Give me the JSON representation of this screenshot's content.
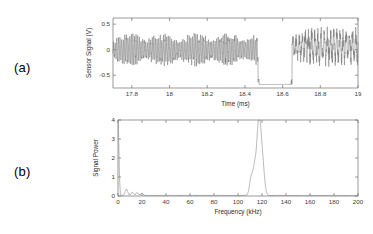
{
  "figure": {
    "panels": [
      {
        "tag": "(a)",
        "name": "time-domain-sensor-signal"
      },
      {
        "tag": "(b)",
        "name": "signal-power-spectrum"
      }
    ]
  },
  "chart_data": [
    {
      "type": "line",
      "panel": "(a)",
      "title": "",
      "xlabel": "Time (ms)",
      "ylabel": "Sensor Signal (V)",
      "xlim": [
        17.7,
        19.0
      ],
      "ylim": [
        -0.75,
        0.62
      ],
      "xticks": [
        17.8,
        18,
        18.2,
        18.4,
        18.6,
        18.8,
        19
      ],
      "xticklabels": [
        "17.8",
        "18",
        "18.2",
        "18.4",
        "18.6",
        "18.8",
        "19"
      ],
      "yticks": [
        0.5,
        0,
        -0.5
      ],
      "yticklabels": [
        "0.5",
        "0",
        "-0.5"
      ],
      "grid": false,
      "legend": false,
      "description": "Noisy oscillatory sensor waveform with amplitude modulation, interrupted by a saturated low-level dropout, followed by a larger-amplitude coarser oscillation.",
      "segments": [
        {
          "name": "modulated-oscillation",
          "x_range": [
            17.7,
            18.47
          ],
          "amplitude": 0.25,
          "carrier_khz": 117,
          "beat_khz": 6
        },
        {
          "name": "dropout-saturation",
          "x_range": [
            18.47,
            18.65
          ],
          "level": -0.68
        },
        {
          "name": "recovered-oscillation",
          "x_range": [
            18.65,
            19.0
          ],
          "amplitude": 0.33,
          "carrier_khz": 60,
          "offset": 0.06
        }
      ]
    },
    {
      "type": "line",
      "panel": "(b)",
      "title": "",
      "xlabel": "Frequency (kHz)",
      "ylabel": "Signal Power",
      "xlim": [
        0,
        200
      ],
      "ylim": [
        0,
        4
      ],
      "xticks": [
        0,
        20,
        40,
        60,
        80,
        100,
        120,
        140,
        160,
        180,
        200
      ],
      "xticklabels": [
        "0",
        "20",
        "40",
        "60",
        "80",
        "100",
        "120",
        "140",
        "160",
        "180",
        "200"
      ],
      "yticks": [
        0,
        1,
        2,
        3,
        4
      ],
      "yticklabels": [
        "0",
        "1",
        "2",
        "3",
        "4"
      ],
      "grid": false,
      "legend": false,
      "description": "Power spectrum with a clipped DC component at 0 kHz, minor low-frequency peaks below 25 kHz, a flat noise floor, and a dominant band near 110-125 kHz peaking at about 3.1.",
      "peaks": [
        {
          "frequency": 0,
          "power": 4.0,
          "note": "clipped DC"
        },
        {
          "frequency": 7,
          "power": 0.33
        },
        {
          "frequency": 12,
          "power": 0.16
        },
        {
          "frequency": 16,
          "power": 0.14
        },
        {
          "frequency": 20,
          "power": 0.1
        },
        {
          "frequency": 111,
          "power": 0.9
        },
        {
          "frequency": 114,
          "power": 1.45
        },
        {
          "frequency": 117,
          "power": 3.1
        },
        {
          "frequency": 119,
          "power": 2.0
        },
        {
          "frequency": 121,
          "power": 1.1
        }
      ],
      "noise_floor": 0.03
    }
  ]
}
